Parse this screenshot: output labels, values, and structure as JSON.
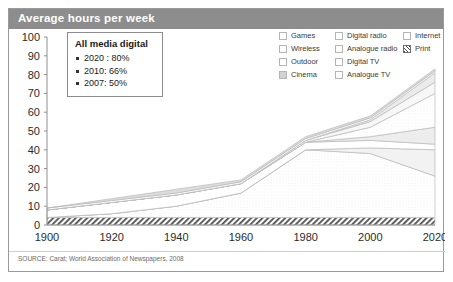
{
  "header": {
    "title": "Average hours per week"
  },
  "source": {
    "text": "SOURCE: Carat; World Association of Newspapers, 2008"
  },
  "callout": {
    "title": "All media digital",
    "items": [
      "2020 : 80%",
      "2010: 66%",
      "2007: 50%"
    ]
  },
  "legend": {
    "rows": [
      [
        {
          "label": "Games",
          "swatch": "empty"
        },
        {
          "label": "Digital radio",
          "swatch": "empty"
        },
        {
          "label": "Internet",
          "swatch": "empty"
        }
      ],
      [
        {
          "label": "Wireless",
          "swatch": "empty"
        },
        {
          "label": "Analogue radio",
          "swatch": "empty"
        },
        {
          "label": "Print",
          "swatch": "hatch"
        }
      ],
      [
        {
          "label": "Outdoor",
          "swatch": "empty"
        },
        {
          "label": "Digital TV",
          "swatch": "empty"
        },
        {
          "label": "",
          "swatch": "none"
        }
      ],
      [
        {
          "label": "Cinema",
          "swatch": "filled"
        },
        {
          "label": "Analogue TV",
          "swatch": "empty"
        },
        {
          "label": "",
          "swatch": "none"
        }
      ]
    ]
  },
  "chart_data": {
    "type": "area",
    "title": "Average hours per week",
    "xlabel": "",
    "ylabel": "",
    "xlim": [
      1900,
      2020
    ],
    "ylim": [
      0,
      100
    ],
    "yticks": [
      0,
      10,
      20,
      30,
      40,
      50,
      60,
      70,
      80,
      90,
      100
    ],
    "xticks": [
      1900,
      1920,
      1940,
      1960,
      1980,
      2000,
      2020
    ],
    "grid": false,
    "legend_position": "top-right",
    "stacked": true,
    "x": [
      1900,
      1920,
      1940,
      1960,
      1980,
      2000,
      2020
    ],
    "series": [
      {
        "name": "Print",
        "swatch": "hatch",
        "values": [
          4,
          4,
          4,
          4,
          4,
          4,
          4
        ]
      },
      {
        "name": "Analogue TV",
        "swatch": "empty",
        "values": [
          0,
          2,
          6,
          13,
          36,
          34,
          22
        ]
      },
      {
        "name": "Digital TV",
        "swatch": "empty",
        "values": [
          0,
          0,
          0,
          0,
          0,
          3,
          14
        ]
      },
      {
        "name": "Analogue radio",
        "swatch": "empty",
        "values": [
          4,
          6,
          6,
          5,
          4,
          4,
          3
        ]
      },
      {
        "name": "Digital radio",
        "swatch": "empty",
        "values": [
          0,
          0,
          0,
          0,
          0,
          2,
          9
        ]
      },
      {
        "name": "Internet",
        "swatch": "empty",
        "values": [
          0,
          0,
          0,
          0,
          0,
          5,
          18
        ]
      },
      {
        "name": "Games",
        "swatch": "empty",
        "values": [
          0,
          0,
          0,
          0,
          1,
          3,
          6
        ]
      },
      {
        "name": "Wireless",
        "swatch": "empty",
        "values": [
          0,
          0,
          0,
          0,
          0,
          1,
          5
        ]
      },
      {
        "name": "Outdoor",
        "swatch": "empty",
        "values": [
          1,
          1,
          1,
          1,
          1,
          1,
          1
        ]
      },
      {
        "name": "Cinema",
        "swatch": "filled",
        "values": [
          0,
          1,
          2,
          1,
          1,
          1,
          1
        ]
      }
    ],
    "totals": [
      9,
      14,
      19,
      24,
      47,
      58,
      83
    ],
    "annotations": [
      {
        "text": "All media digital",
        "values": [
          "2020 : 80%",
          "2010: 66%",
          "2007: 50%"
        ]
      }
    ]
  }
}
